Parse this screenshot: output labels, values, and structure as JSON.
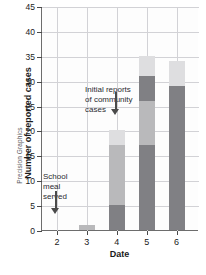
{
  "chart_data": {
    "type": "bar",
    "subtype": "stacked-bar",
    "title": "",
    "xlabel": "Date",
    "ylabel": "Number of reported cases",
    "categories": [
      "2",
      "3",
      "4",
      "5",
      "6"
    ],
    "x": [
      2,
      3,
      4,
      5,
      6
    ],
    "xlim": [
      1.5,
      6.75
    ],
    "ylim": [
      0,
      45
    ],
    "ytick_labels": [
      "0",
      "5",
      "10",
      "15",
      "20",
      "25",
      "30",
      "35",
      "40",
      "45"
    ],
    "ytick_values": [
      0,
      5,
      10,
      15,
      20,
      25,
      30,
      35,
      40,
      45
    ],
    "xtick_labels": [
      "2",
      "3",
      "4",
      "5",
      "6"
    ],
    "grid": true,
    "legend": "none",
    "series": [
      {
        "name": "segment-1",
        "color": "#808084",
        "values": [
          0,
          0,
          5,
          17,
          24
        ]
      },
      {
        "name": "segment-2",
        "color": "#b9b9bb",
        "values": [
          0,
          1,
          12,
          9,
          0
        ]
      },
      {
        "name": "segment-3",
        "color": "#808084",
        "values": [
          0,
          0,
          0,
          5,
          5
        ]
      },
      {
        "name": "segment-4",
        "color": "#dedee0",
        "values": [
          0,
          0,
          3,
          4,
          5
        ]
      }
    ],
    "totals": [
      0,
      1,
      20,
      35,
      34
    ],
    "annotations": [
      {
        "name": "community-cases",
        "text": "Initial reports\nof community\ncases",
        "points_to_x": 4,
        "arrow": "down"
      },
      {
        "name": "school-meal",
        "text": "School\nmeal\nserved",
        "points_to_x": 2,
        "arrow": "down"
      }
    ],
    "credit": "Precision Graphics"
  },
  "axes": {
    "y_title": "Number of reported cases",
    "x_title": "Date"
  },
  "credit": {
    "text": "Precision Graphics"
  },
  "annotations": {
    "community": "Initial reports\nof community\ncases",
    "school": "School\nmeal\nserved"
  }
}
